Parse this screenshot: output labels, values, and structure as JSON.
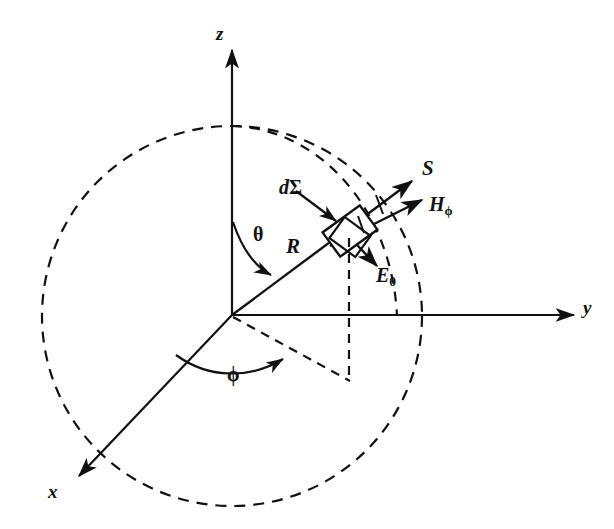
{
  "figure": {
    "type": "physics-vector-diagram",
    "background_color": "#ffffff",
    "stroke_color": "#111111"
  },
  "axes": [
    {
      "name": "z-axis",
      "label": "z",
      "label_x": 222,
      "label_y": 27,
      "from": [
        232,
        315
      ],
      "to": [
        232,
        48
      ]
    },
    {
      "name": "y-axis",
      "label": "y",
      "label_x": 585,
      "label_y": 300,
      "from": [
        232,
        315
      ],
      "to": [
        576,
        315
      ]
    },
    {
      "name": "x-axis",
      "label": "x",
      "label_x": 50,
      "label_y": 484,
      "from": [
        232,
        315
      ],
      "to": [
        77,
        478
      ]
    }
  ],
  "angles": [
    {
      "name": "theta",
      "label": "θ",
      "label_x": 255,
      "label_y": 226,
      "description": "polar angle from z-axis to radius R"
    },
    {
      "name": "phi",
      "label": "ϕ",
      "label_x": 229,
      "label_y": 365,
      "description": "azimuthal angle in xy-plane"
    }
  ],
  "vectors": [
    {
      "name": "radius",
      "label": "R",
      "label_x": 288,
      "label_y": 238,
      "style": "italic-bold"
    },
    {
      "name": "poynting",
      "label": "S",
      "label_x": 424,
      "label_y": 160,
      "style": "italic-bold"
    },
    {
      "name": "magnetic-field",
      "label": "H",
      "subscript": "ϕ",
      "label_x": 431,
      "label_y": 196,
      "style": "italic-bold"
    },
    {
      "name": "electric-field",
      "label": "E",
      "subscript": "θ",
      "label_x": 378,
      "label_y": 267,
      "style": "italic-bold"
    }
  ],
  "area_element": {
    "name": "differential-area",
    "label_italic": "d",
    "label_greek": "Σ",
    "label_x": 281,
    "label_y": 179,
    "center": [
      350,
      231
    ],
    "description": "small rotated square patch on the sphere surface"
  },
  "sphere": {
    "name": "dashed-sphere-outline",
    "center": [
      232,
      316
    ],
    "radius": 190,
    "line_style": "dashed"
  },
  "meridian_arc": {
    "name": "dashed-meridian-arc",
    "line_style": "dashed"
  },
  "projection_lines": {
    "name": "dashed-projection-lines",
    "line_style": "dashed"
  }
}
